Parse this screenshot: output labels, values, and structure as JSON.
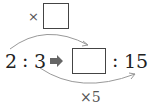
{
  "diagram": {
    "type": "ratio-equivalence",
    "top_operator": "×",
    "top_blank": "",
    "left_ratio": {
      "a": "2",
      "colon": ":",
      "b": "3"
    },
    "right_ratio": {
      "a_blank": "",
      "colon": ":",
      "b": "15"
    },
    "bottom_operator_label": "×5",
    "arrow": "➡",
    "colors": {
      "line": "#888888",
      "text": "#222222",
      "arrow": "#666666"
    }
  }
}
